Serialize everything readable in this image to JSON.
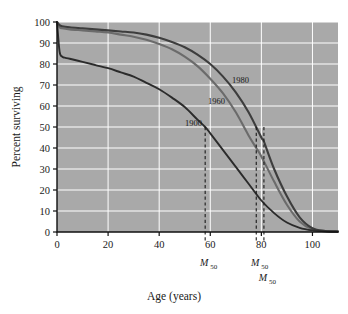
{
  "chart_data": {
    "type": "line",
    "title": "",
    "subtitle": "",
    "xlabel": "Age (years)",
    "ylabel": "Percent surviving",
    "xlim": [
      0,
      110
    ],
    "ylim": [
      0,
      100
    ],
    "xticks": [
      0,
      20,
      40,
      60,
      80,
      100
    ],
    "xtick_labels": [
      "0",
      "20",
      "40",
      "60",
      "80",
      "100"
    ],
    "yticks": [
      0,
      10,
      20,
      30,
      40,
      50,
      60,
      70,
      80,
      90,
      100
    ],
    "ytick_labels": [
      "0",
      "10",
      "20",
      "30",
      "40",
      "50",
      "60",
      "70",
      "80",
      "90",
      "100"
    ],
    "grid": true,
    "grid_color": "#ffffff",
    "plot_background": "#a9a9a9",
    "legend": "inline-labels",
    "legend_position": "on-curve",
    "series": [
      {
        "name": "1900",
        "label": "1900",
        "color": "#2b2b2b",
        "median_survival_age": 58,
        "x": [
          0,
          1,
          2,
          3,
          5,
          10,
          15,
          20,
          25,
          30,
          35,
          40,
          45,
          50,
          55,
          58,
          60,
          65,
          70,
          75,
          80,
          85,
          90,
          95,
          100,
          105,
          110
        ],
        "values": [
          100,
          86,
          83.5,
          83,
          82.5,
          81,
          79.5,
          78,
          76,
          74,
          71,
          68,
          64,
          59.5,
          53.5,
          50,
          47,
          39,
          31,
          23,
          15,
          9,
          4.5,
          2,
          0.8,
          0.3,
          0.2
        ]
      },
      {
        "name": "1960",
        "label": "1960",
        "color": "#6b6b6b",
        "median_survival_age": 78,
        "x": [
          0,
          1,
          2,
          5,
          10,
          15,
          20,
          25,
          30,
          35,
          40,
          45,
          50,
          55,
          60,
          65,
          70,
          75,
          78,
          80,
          85,
          90,
          95,
          100,
          105,
          110
        ],
        "values": [
          100,
          97.5,
          97,
          96.5,
          96,
          95.5,
          95,
          94,
          93,
          91.5,
          89.5,
          87,
          83.5,
          79,
          73,
          66,
          57,
          46,
          40,
          36,
          24,
          13,
          5,
          1.2,
          0.4,
          0.2
        ]
      },
      {
        "name": "1980",
        "label": "1980",
        "color": "#3d3d3d",
        "median_survival_age": 81,
        "x": [
          0,
          1,
          2,
          5,
          10,
          15,
          20,
          25,
          30,
          35,
          40,
          45,
          50,
          55,
          60,
          65,
          70,
          75,
          80,
          81,
          85,
          90,
          95,
          100,
          105,
          110
        ],
        "values": [
          100,
          98.5,
          98,
          97.5,
          97,
          96.5,
          96,
          95.5,
          95,
          94,
          92.5,
          90.5,
          88,
          84.5,
          80,
          74,
          66.5,
          57,
          45,
          43,
          30,
          17,
          7,
          1.8,
          0.5,
          0.2
        ]
      }
    ],
    "annotations": [
      {
        "name": "m50-1900",
        "label": "M",
        "subscript": "50",
        "x": 58,
        "y_from": 50,
        "y_to": 0,
        "style": "dashed-vertical",
        "color": "#1a1a1a"
      },
      {
        "name": "m50-1960",
        "label": "M",
        "subscript": "50",
        "x": 78,
        "y_from": 50,
        "y_to": 0,
        "style": "dashed-vertical",
        "color": "#1a1a1a"
      },
      {
        "name": "m50-1980",
        "label": "M",
        "subscript": "50",
        "x": 81,
        "y_from": 50,
        "y_to": 0,
        "style": "dashed-vertical",
        "color": "#1a1a1a"
      }
    ]
  },
  "axes": {
    "x_title": "Age (years)",
    "y_title": "Percent surviving"
  },
  "ticks": {
    "x": [
      "0",
      "20",
      "40",
      "60",
      "80",
      "100"
    ],
    "y": [
      "100",
      "90",
      "80",
      "70",
      "60",
      "50",
      "40",
      "30",
      "20",
      "10",
      "0"
    ]
  },
  "curve_labels": {
    "c1900": "1900",
    "c1960": "1960",
    "c1980": "1980"
  },
  "m50_labels": {
    "base": "M",
    "sub": "50"
  }
}
